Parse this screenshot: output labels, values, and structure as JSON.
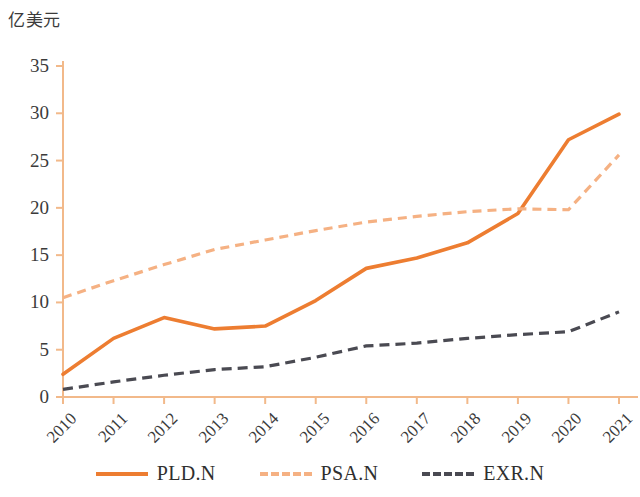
{
  "chart_data": {
    "type": "line",
    "title": "",
    "ylabel": "亿美元",
    "xlabel": "",
    "ylim": [
      0,
      35
    ],
    "yticks": [
      0,
      5,
      10,
      15,
      20,
      25,
      30,
      35
    ],
    "grid": false,
    "legend_position": "bottom",
    "categories": [
      "2010",
      "2011",
      "2012",
      "2013",
      "2014",
      "2015",
      "2016",
      "2017",
      "2018",
      "2019",
      "2020",
      "2021"
    ],
    "series": [
      {
        "name": "PLD.N",
        "style": "solid",
        "color": "#ED7D31",
        "values": [
          2.4,
          6.2,
          8.4,
          7.2,
          7.5,
          10.2,
          13.6,
          14.7,
          16.3,
          19.4,
          27.2,
          29.9
        ]
      },
      {
        "name": "PSA.N",
        "style": "dashed",
        "color": "#F5B183",
        "values": [
          10.5,
          12.3,
          14.0,
          15.6,
          16.6,
          17.6,
          18.5,
          19.1,
          19.6,
          19.9,
          19.8,
          25.6
        ]
      },
      {
        "name": "EXR.N",
        "style": "dashed",
        "color": "#4A4A52",
        "values": [
          0.8,
          1.6,
          2.3,
          2.9,
          3.2,
          4.2,
          5.4,
          5.7,
          6.2,
          6.6,
          6.9,
          9.0
        ]
      }
    ]
  },
  "axis": {
    "title": "亿美元",
    "y_tick_labels": [
      "35",
      "30",
      "25",
      "20",
      "15",
      "10",
      "5",
      "0"
    ],
    "x_tick_labels": [
      "2010",
      "2011",
      "2012",
      "2013",
      "2014",
      "2015",
      "2016",
      "2017",
      "2018",
      "2019",
      "2020",
      "2021"
    ],
    "axis_color": "#F2B98A"
  },
  "legend": {
    "items": [
      {
        "label": "PLD.N",
        "color": "#ED7D31",
        "style": "solid"
      },
      {
        "label": "PSA.N",
        "color": "#F5B183",
        "style": "dashed"
      },
      {
        "label": "EXR.N",
        "color": "#4A4A52",
        "style": "dashed"
      }
    ]
  }
}
